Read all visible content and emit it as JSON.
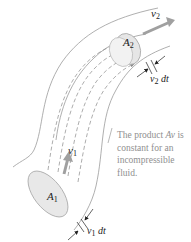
{
  "diagram": {
    "labels": {
      "v2": {
        "symbol": "v",
        "sub": "2"
      },
      "A2": {
        "symbol": "A",
        "sub": "2"
      },
      "v2dt": {
        "symbol": "v",
        "sub": "2",
        "suffix": " dt"
      },
      "v1": {
        "symbol": "v",
        "sub": "1"
      },
      "A1": {
        "symbol": "A",
        "sub": "1"
      },
      "v1dt": {
        "symbol": "v",
        "sub": "1",
        "suffix": " dt"
      }
    },
    "caption": {
      "line1_pre": "The product ",
      "line1_var": "Av",
      "line1_post": " is",
      "line2": "constant for an",
      "line3": "incompressible",
      "line4": "fluid."
    },
    "colors": {
      "tube_outline": "#9a9a9a",
      "streamline": "#8a8a8a",
      "velocity_arrow": "#a0a0a0",
      "disk_fill": "#e6e6e6",
      "caption_text": "#8f8f8f",
      "label_text": "#222222"
    }
  }
}
